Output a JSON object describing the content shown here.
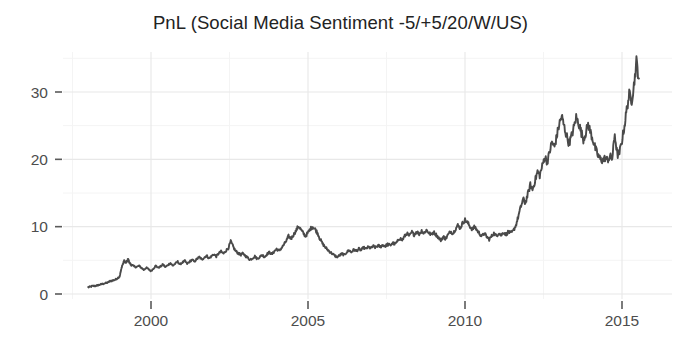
{
  "chart_data": {
    "type": "line",
    "title": "PnL (Social Media Sentiment -5/+5/20/W/US)",
    "xlabel": "",
    "ylabel": "",
    "xlim": [
      1997.8,
      1915.6
    ],
    "x_range": [
      1997.8,
      2015.6
    ],
    "ylim": [
      -1.2,
      36.5
    ],
    "grid": true,
    "grid_major_color": "#e8e8e8",
    "grid_minor_color": "#f4f4f4",
    "legend": "none",
    "line_color": "#4a4a4a",
    "background": "#ffffff",
    "xticks": [
      2000,
      2005,
      2010,
      2015
    ],
    "xtick_labels": [
      "2000",
      "2005",
      "2010",
      "2015"
    ],
    "yticks": [
      0,
      10,
      20,
      30
    ],
    "ytick_labels": [
      "0",
      "10",
      "20",
      "30"
    ],
    "y_minor_ticks": [
      5,
      15,
      25,
      35
    ],
    "x_minor_ticks": [
      1997.5,
      2002.5,
      2007.5,
      2012.5
    ],
    "series": [
      {
        "name": "PnL",
        "x": [
          1998.0,
          1998.08,
          1998.15,
          1998.23,
          1998.31,
          1998.38,
          1998.46,
          1998.54,
          1998.62,
          1998.69,
          1998.77,
          1998.85,
          1998.92,
          1999.0,
          1999.04,
          1999.08,
          1999.12,
          1999.15,
          1999.19,
          1999.23,
          1999.27,
          1999.31,
          1999.35,
          1999.38,
          1999.46,
          1999.54,
          1999.62,
          1999.69,
          1999.77,
          1999.85,
          1999.92,
          2000.0,
          2000.08,
          2000.15,
          2000.23,
          2000.31,
          2000.38,
          2000.46,
          2000.54,
          2000.62,
          2000.69,
          2000.77,
          2000.85,
          2000.92,
          2001.0,
          2001.08,
          2001.15,
          2001.23,
          2001.31,
          2001.38,
          2001.46,
          2001.54,
          2001.62,
          2001.69,
          2001.77,
          2001.85,
          2001.92,
          2002.0,
          2002.08,
          2002.15,
          2002.23,
          2002.31,
          2002.38,
          2002.46,
          2002.54,
          2002.62,
          2002.69,
          2002.77,
          2002.85,
          2002.92,
          2003.0,
          2003.08,
          2003.15,
          2003.23,
          2003.31,
          2003.38,
          2003.46,
          2003.54,
          2003.62,
          2003.69,
          2003.77,
          2003.85,
          2003.92,
          2004.0,
          2004.08,
          2004.15,
          2004.23,
          2004.31,
          2004.38,
          2004.46,
          2004.54,
          2004.62,
          2004.69,
          2004.77,
          2004.85,
          2004.92,
          2005.0,
          2005.08,
          2005.15,
          2005.23,
          2005.31,
          2005.38,
          2005.46,
          2005.54,
          2005.62,
          2005.69,
          2005.77,
          2005.85,
          2005.92,
          2006.0,
          2006.08,
          2006.15,
          2006.23,
          2006.31,
          2006.38,
          2006.46,
          2006.54,
          2006.62,
          2006.69,
          2006.77,
          2006.85,
          2006.92,
          2007.0,
          2007.08,
          2007.15,
          2007.23,
          2007.31,
          2007.38,
          2007.46,
          2007.54,
          2007.62,
          2007.69,
          2007.77,
          2007.85,
          2007.92,
          2008.0,
          2008.08,
          2008.15,
          2008.23,
          2008.31,
          2008.38,
          2008.46,
          2008.54,
          2008.62,
          2008.69,
          2008.77,
          2008.85,
          2008.92,
          2009.0,
          2009.08,
          2009.15,
          2009.23,
          2009.31,
          2009.38,
          2009.46,
          2009.54,
          2009.62,
          2009.69,
          2009.77,
          2009.85,
          2009.92,
          2010.0,
          2010.08,
          2010.15,
          2010.23,
          2010.31,
          2010.38,
          2010.46,
          2010.54,
          2010.62,
          2010.69,
          2010.77,
          2010.85,
          2010.92,
          2011.0,
          2011.08,
          2011.15,
          2011.23,
          2011.31,
          2011.38,
          2011.46,
          2011.54,
          2011.62,
          2011.69,
          2011.77,
          2011.85,
          2011.92,
          2012.0,
          2012.08,
          2012.15,
          2012.23,
          2012.31,
          2012.38,
          2012.46,
          2012.54,
          2012.62,
          2012.69,
          2012.77,
          2012.85,
          2012.92,
          2013.0,
          2013.08,
          2013.15,
          2013.23,
          2013.31,
          2013.38,
          2013.46,
          2013.54,
          2013.62,
          2013.69,
          2013.77,
          2013.85,
          2013.92,
          2014.0,
          2014.08,
          2014.15,
          2014.23,
          2014.31,
          2014.38,
          2014.46,
          2014.54,
          2014.62,
          2014.69,
          2014.77,
          2014.85,
          2014.92,
          2015.0,
          2015.08,
          2015.15,
          2015.23,
          2015.31,
          2015.38,
          2015.46,
          2015.54
        ],
        "y": [
          1.0,
          1.1,
          1.2,
          1.2,
          1.3,
          1.4,
          1.5,
          1.6,
          1.7,
          1.9,
          2.0,
          2.1,
          2.3,
          2.6,
          3.4,
          4.2,
          4.6,
          5.0,
          4.6,
          4.8,
          5.2,
          4.7,
          4.4,
          4.3,
          4.1,
          4.0,
          4.2,
          3.9,
          3.6,
          3.9,
          3.7,
          3.4,
          3.8,
          4.2,
          3.9,
          4.1,
          4.4,
          4.0,
          4.3,
          4.6,
          4.2,
          4.5,
          4.8,
          4.4,
          4.7,
          4.9,
          4.5,
          4.8,
          5.1,
          4.8,
          5.2,
          5.5,
          5.1,
          5.4,
          5.7,
          5.3,
          5.6,
          5.9,
          5.6,
          6.0,
          6.3,
          6.0,
          6.4,
          6.8,
          7.8,
          7.0,
          6.4,
          6.1,
          5.8,
          6.0,
          5.7,
          5.4,
          5.1,
          5.3,
          5.6,
          5.2,
          5.5,
          5.8,
          5.5,
          5.9,
          6.2,
          5.9,
          6.3,
          6.7,
          6.4,
          6.8,
          7.3,
          7.9,
          8.6,
          8.2,
          8.8,
          9.4,
          10.1,
          9.6,
          9.0,
          8.6,
          9.1,
          9.7,
          10.0,
          9.6,
          9.0,
          8.2,
          7.5,
          7.0,
          6.6,
          6.3,
          6.0,
          5.7,
          5.5,
          5.7,
          6.0,
          5.8,
          6.2,
          6.5,
          6.2,
          6.6,
          6.4,
          6.7,
          6.5,
          6.9,
          6.7,
          7.0,
          6.8,
          7.1,
          6.9,
          7.2,
          7.0,
          7.3,
          7.1,
          7.4,
          7.2,
          7.6,
          7.4,
          7.8,
          8.3,
          8.0,
          8.6,
          9.0,
          8.6,
          9.2,
          8.8,
          9.3,
          8.9,
          9.4,
          9.0,
          9.5,
          9.1,
          8.8,
          9.2,
          8.8,
          8.4,
          8.0,
          8.5,
          8.2,
          8.8,
          9.3,
          9.0,
          9.6,
          10.2,
          9.8,
          10.5,
          11.0,
          10.6,
          10.1,
          9.6,
          10.0,
          9.5,
          9.0,
          8.6,
          9.0,
          8.5,
          8.1,
          8.6,
          9.0,
          8.6,
          9.1,
          8.7,
          9.2,
          8.8,
          9.3,
          9.0,
          9.4,
          10.2,
          11.4,
          12.8,
          14.1,
          13.5,
          14.8,
          16.2,
          15.5,
          16.8,
          18.2,
          17.6,
          19.0,
          20.4,
          19.6,
          21.0,
          22.6,
          21.8,
          23.4,
          25.2,
          26.4,
          25.0,
          23.6,
          22.4,
          23.2,
          24.6,
          26.2,
          25.4,
          24.2,
          23.0,
          24.0,
          25.2,
          24.0,
          22.8,
          21.6,
          20.6,
          20.0,
          19.8,
          20.2,
          19.9,
          20.4,
          20.1,
          23.8,
          20.6,
          21.0,
          22.8,
          25.0,
          27.4,
          29.6,
          28.8,
          31.0,
          34.5,
          32.0
        ]
      }
    ]
  },
  "axes": {
    "y_title": "",
    "x_title": ""
  }
}
